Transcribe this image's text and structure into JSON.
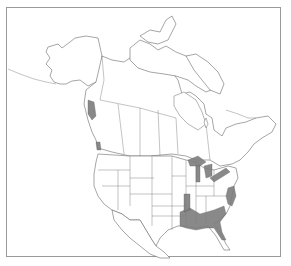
{
  "map": {
    "region": "North America",
    "projection_style": "outline map with state/province boundaries",
    "colors": {
      "background": "#ffffff",
      "frame": "#9a9a9a",
      "outline": "#6a6a6a",
      "range_fill": "#7d7d7d"
    },
    "shaded_regions": [
      "Pacific Northwest coast (Vancouver Island / Puget Sound)",
      "Oregon coast",
      "Great Lakes shorelines (Lake Superior, Lake Michigan, Lake Huron, Lake Erie, Lake Ontario)",
      "Atlantic coast (New Jersey to North Carolina)",
      "Southeastern United States (Louisiana, Mississippi, Alabama, Georgia, South Carolina, northern Florida)",
      "Lower Mississippi valley"
    ],
    "legend": null,
    "labels": []
  }
}
